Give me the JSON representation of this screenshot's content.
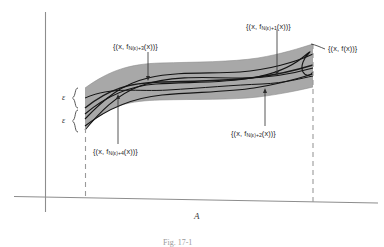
{
  "figure": {
    "type": "uniform-convergence-diagram",
    "band_color": "#a8a8a8",
    "curve_color": "#1a1a1a",
    "axis_color": "#8d8d8d",
    "dashed_color": "#9a9a9a",
    "text_color": "#2b2b2b"
  },
  "labels": {
    "f_limit": {
      "prefix": "{(x, f",
      "sub": "",
      "suffix": "(x))}",
      "full": "{(x, f(x))}"
    },
    "f_n1": {
      "prefix": "{(x, f",
      "sub": "N(ε)+1",
      "suffix": "(x))}",
      "full": "{(x, f_N(ε)+1(x))}"
    },
    "f_n2": {
      "prefix": "{(x, f",
      "sub": "N(ε)+2",
      "suffix": "(x))}",
      "full": "{(x, f_N(ε)+2(x))}"
    },
    "f_n3": {
      "prefix": "{(x, f",
      "sub": "N(ε)+3",
      "suffix": "(x))}",
      "full": "{(x, f_N(ε)+3(x))}"
    },
    "f_n4": {
      "prefix": "{(x, f",
      "sub": "N(ε)+4",
      "suffix": "(x))}",
      "full": "{(x, f_N(ε)+4(x))}"
    },
    "epsilon_upper": "ε",
    "epsilon_lower": "ε",
    "interval": "A",
    "caption": "Fig. 17-1"
  }
}
